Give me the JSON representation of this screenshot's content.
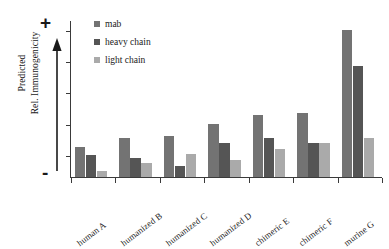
{
  "chart_data": {
    "type": "bar",
    "title": "",
    "subtitle": "",
    "xlabel": "",
    "ylabel": "Predicted Rel. Immunogenicity",
    "ylabel_lines": [
      "Predicted",
      "Rel. Immunogenicity"
    ],
    "axis_markers": {
      "top": "+",
      "bottom": "-"
    },
    "grid": false,
    "legend_position": "top-left",
    "ylim": [
      0,
      100
    ],
    "y_tick_labels": [],
    "y_tick_count": 5,
    "categories": [
      "human A",
      "humanized B",
      "humanized C",
      "humanized D",
      "chimeric E",
      "chimeric F",
      "murine G"
    ],
    "series": [
      {
        "name": "mab",
        "color": "#737373",
        "values": [
          19,
          25,
          26,
          34,
          40,
          41,
          94
        ]
      },
      {
        "name": "heavy chain",
        "color": "#555555",
        "values": [
          14,
          12,
          7,
          22,
          25,
          22,
          71
        ]
      },
      {
        "name": "light chain",
        "color": "#aaaaaa",
        "values": [
          4,
          9,
          15,
          11,
          18,
          22,
          25
        ]
      }
    ]
  },
  "legend": {
    "items": [
      {
        "label": "mab",
        "color": "#737373"
      },
      {
        "label": "heavy chain",
        "color": "#555555"
      },
      {
        "label": "light chain",
        "color": "#aaaaaa"
      }
    ]
  },
  "axis": {
    "y_label_line1": "Predicted",
    "y_label_line2": "Rel. Immunogenicity",
    "plus": "+",
    "minus": "-"
  },
  "colors": {
    "mab": "#737373",
    "heavy_chain": "#555555",
    "light_chain": "#aaaaaa",
    "axis": "#3a3a3a",
    "background": "#ffffff"
  }
}
